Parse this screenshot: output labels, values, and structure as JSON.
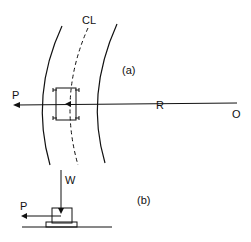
{
  "diagram": {
    "labels": {
      "centerline": "CL",
      "part_a": "(a)",
      "part_b": "(b)",
      "force_p_a": "P",
      "radius": "R",
      "origin": "O",
      "weight": "W",
      "force_p_b": "P"
    },
    "colors": {
      "stroke": "#111111",
      "background": "#ffffff"
    }
  }
}
